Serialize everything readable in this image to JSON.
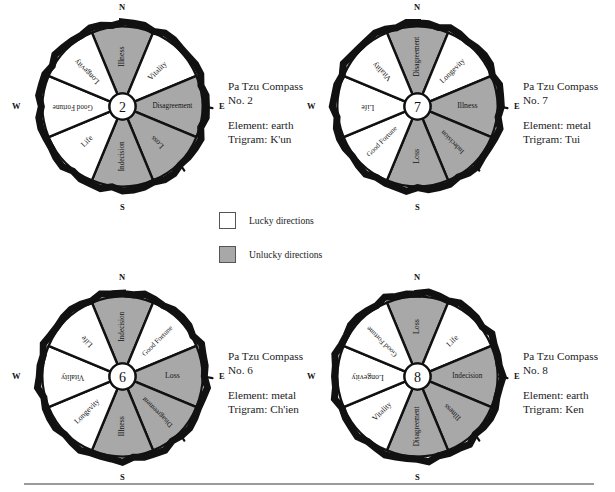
{
  "colors": {
    "lucky": "#ffffff",
    "unlucky": "#a8a8a8",
    "ink": "#111111",
    "rule": "#9a9a9a"
  },
  "legend": {
    "name": "legend",
    "items": [
      {
        "swatch": "lucky",
        "label": "Lucky directions"
      },
      {
        "swatch": "unlucky",
        "label": "Unlucky directions"
      }
    ]
  },
  "cardinals": {
    "n": "N",
    "e": "E",
    "s": "S",
    "w": "W"
  },
  "compasses": [
    {
      "id": "compass-2",
      "center": "2",
      "title": "Pa Tzu Compass",
      "number": "No. 2",
      "element": "Element: earth",
      "trigram": "Trigram: K'un",
      "segments": [
        {
          "label": "Illness",
          "luck": "unlucky"
        },
        {
          "label": "Vitality",
          "luck": "lucky"
        },
        {
          "label": "Disagreement",
          "luck": "unlucky"
        },
        {
          "label": "Loss",
          "luck": "unlucky"
        },
        {
          "label": "Indecision",
          "luck": "unlucky"
        },
        {
          "label": "Life",
          "luck": "lucky"
        },
        {
          "label": "Good Fortune",
          "luck": "lucky"
        },
        {
          "label": "Longevity",
          "luck": "lucky"
        }
      ]
    },
    {
      "id": "compass-7",
      "center": "7",
      "title": "Pa Tzu Compass",
      "number": "No. 7",
      "element": "Element: metal",
      "trigram": "Trigram: Tui",
      "segments": [
        {
          "label": "Disagreement",
          "luck": "unlucky"
        },
        {
          "label": "Longevity",
          "luck": "lucky"
        },
        {
          "label": "Illness",
          "luck": "unlucky"
        },
        {
          "label": "Indecision",
          "luck": "unlucky"
        },
        {
          "label": "Loss",
          "luck": "unlucky"
        },
        {
          "label": "Good Fortune",
          "luck": "lucky"
        },
        {
          "label": "Life",
          "luck": "lucky"
        },
        {
          "label": "Vitality",
          "luck": "lucky"
        }
      ]
    },
    {
      "id": "compass-6",
      "center": "6",
      "title": "Pa Tzu Compass",
      "number": "No. 6",
      "element": "Element: metal",
      "trigram": "Trigram: Ch'ien",
      "segments": [
        {
          "label": "Indecision",
          "luck": "unlucky"
        },
        {
          "label": "Good Fortune",
          "luck": "lucky"
        },
        {
          "label": "Loss",
          "luck": "unlucky"
        },
        {
          "label": "Disagreement",
          "luck": "unlucky"
        },
        {
          "label": "Illness",
          "luck": "unlucky"
        },
        {
          "label": "Longevity",
          "luck": "lucky"
        },
        {
          "label": "Vitality",
          "luck": "lucky"
        },
        {
          "label": "Life",
          "luck": "lucky"
        }
      ]
    },
    {
      "id": "compass-8",
      "center": "8",
      "title": "Pa Tzu Compass",
      "number": "No. 8",
      "element": "Element: earth",
      "trigram": "Trigram: Ken",
      "segments": [
        {
          "label": "Loss",
          "luck": "unlucky"
        },
        {
          "label": "Life",
          "luck": "lucky"
        },
        {
          "label": "Indecision",
          "luck": "unlucky"
        },
        {
          "label": "Illness",
          "luck": "unlucky"
        },
        {
          "label": "Disagreement",
          "luck": "unlucky"
        },
        {
          "label": "Vitality",
          "luck": "lucky"
        },
        {
          "label": "Longevity",
          "luck": "lucky"
        },
        {
          "label": "Good Fortune",
          "luck": "lucky"
        }
      ]
    }
  ]
}
